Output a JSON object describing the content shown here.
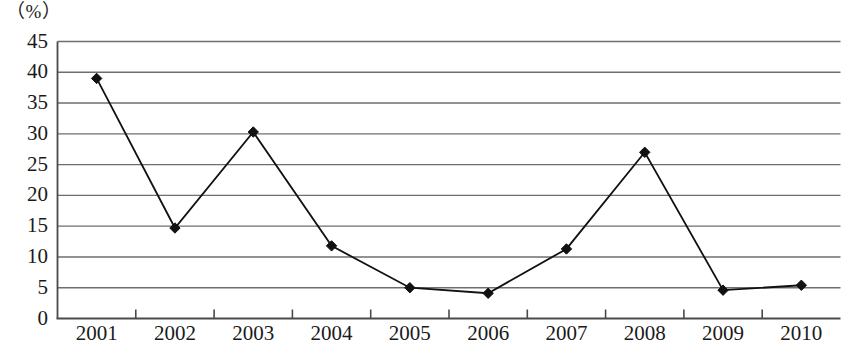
{
  "chart_data": {
    "type": "line",
    "title": "",
    "subtitle": "",
    "xlabel": "",
    "ylabel": "",
    "unit_label": "（%）",
    "categories": [
      "2001",
      "2002",
      "2003",
      "2004",
      "2005",
      "2006",
      "2007",
      "2008",
      "2009",
      "2010"
    ],
    "values": [
      39,
      14.7,
      30.3,
      11.8,
      5,
      4.1,
      11.3,
      27,
      4.6,
      5.4
    ],
    "series": [
      {
        "name": "",
        "values": [
          39,
          14.7,
          30.3,
          11.8,
          5,
          4.1,
          11.3,
          27,
          4.6,
          5.4
        ]
      }
    ],
    "ylim": [
      0,
      45
    ],
    "ytick_step": 5,
    "yticks": [
      "0",
      "5",
      "10",
      "15",
      "20",
      "25",
      "30",
      "35",
      "40",
      "45"
    ],
    "xticks": [
      "2001",
      "2002",
      "2003",
      "2004",
      "2005",
      "2006",
      "2007",
      "2008",
      "2009",
      "2010"
    ],
    "grid": true,
    "grid_axis": "y",
    "legend": false,
    "legend_position": "none",
    "marker": "diamond",
    "line_color": "#111111",
    "marker_color": "#111111",
    "grid_color": "#6e6e6e",
    "axis_color": "#4a4a4a",
    "background_color": "#ffffff"
  }
}
